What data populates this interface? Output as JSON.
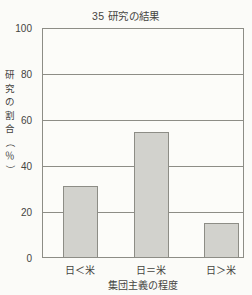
{
  "chart_data": {
    "type": "bar",
    "title": "35 研究の結果",
    "xlabel": "集団主義の程度",
    "ylabel": "研究の割合（％）",
    "categories": [
      "日＜米",
      "日＝米",
      "日＞米"
    ],
    "values": [
      31,
      55,
      15
    ],
    "ylim": [
      0,
      100
    ],
    "yticks": [
      0,
      20,
      40,
      60,
      80,
      100
    ],
    "ytick_labels": [
      "0",
      "20",
      "40",
      "60",
      "80",
      "100"
    ],
    "grid": true,
    "legend": false,
    "series": [
      {
        "name": "研究の割合",
        "values": [
          31,
          55,
          15
        ]
      }
    ],
    "colors": {
      "bar_fill": "#d2d2cd",
      "bar_border": "#8d8d86",
      "axis": "#8d8d86",
      "text": "#45443f",
      "background": "#fbfbf8"
    }
  },
  "y_axis_title_chars": [
    "研",
    "究",
    "の",
    "割",
    "合",
    "（",
    "％",
    "）"
  ]
}
